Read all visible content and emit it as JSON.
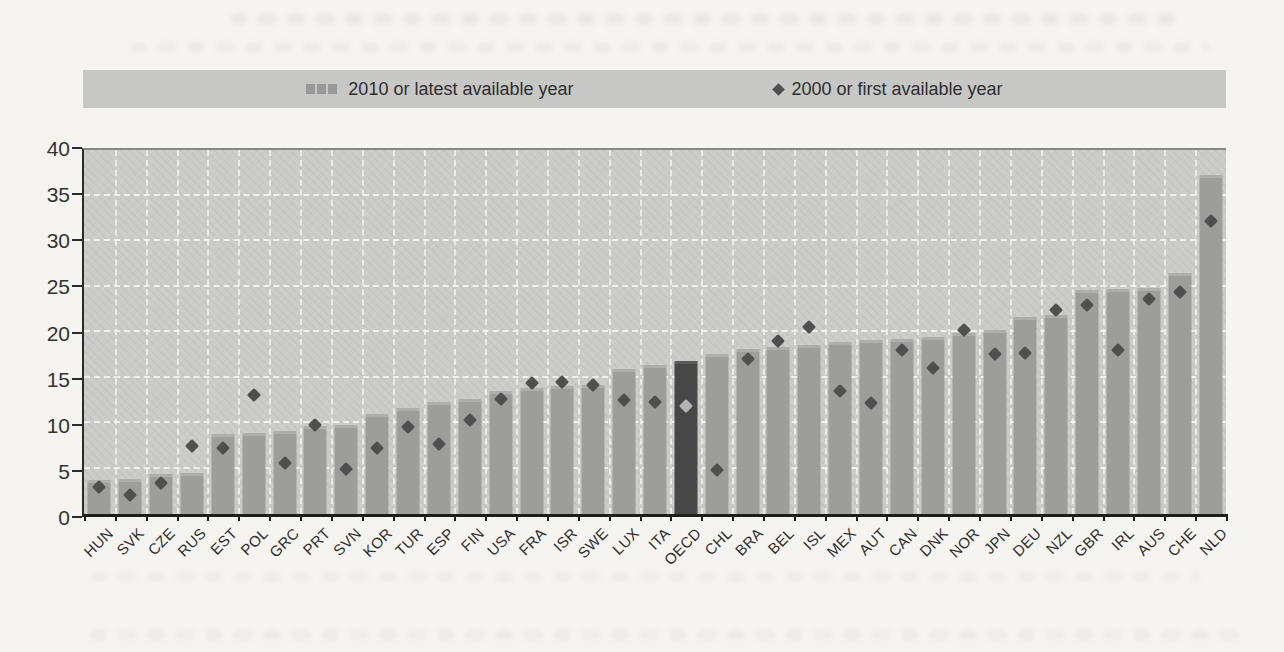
{
  "legend": {
    "items": [
      {
        "icon": "bar-swatch-icon",
        "label": "2010 or latest available year"
      },
      {
        "icon": "diamond-icon",
        "label": "2000 or first available year"
      }
    ]
  },
  "chart_data": {
    "type": "bar",
    "title": "",
    "categories": [
      "HUN",
      "SVK",
      "CZE",
      "RUS",
      "EST",
      "POL",
      "GRC",
      "PRT",
      "SVN",
      "KOR",
      "TUR",
      "ESP",
      "FIN",
      "USA",
      "FRA",
      "ISR",
      "SWE",
      "LUX",
      "ITA",
      "OECD",
      "CHL",
      "BRA",
      "BEL",
      "ISL",
      "MEX",
      "AUT",
      "CAN",
      "DNK",
      "NOR",
      "JPN",
      "DEU",
      "NZL",
      "GBR",
      "IRL",
      "AUS",
      "CHE",
      "NLD"
    ],
    "series": [
      {
        "name": "2010 or latest available year",
        "marker": "bar",
        "values": [
          3.7,
          3.8,
          4.4,
          4.5,
          8.8,
          8.9,
          9.1,
          9.7,
          9.8,
          11.0,
          11.6,
          12.3,
          12.6,
          13.5,
          13.9,
          14.1,
          14.2,
          15.9,
          16.4,
          16.8,
          17.6,
          18.1,
          18.4,
          18.6,
          18.9,
          19.1,
          19.2,
          19.5,
          19.9,
          20.2,
          21.6,
          21.9,
          24.6,
          24.7,
          24.8,
          26.5,
          37.3
        ]
      },
      {
        "name": "2000 or first available year",
        "marker": "diamond",
        "values": [
          3.0,
          2.1,
          3.4,
          7.5,
          7.3,
          13.1,
          5.6,
          9.8,
          5.0,
          7.2,
          9.6,
          7.7,
          10.3,
          12.6,
          14.4,
          14.5,
          14.2,
          12.5,
          12.3,
          11.9,
          4.8,
          17.0,
          19.0,
          20.6,
          13.5,
          12.2,
          18.0,
          16.0,
          20.2,
          17.6,
          17.7,
          22.4,
          23.0,
          18.0,
          23.6,
          24.4,
          32.2
        ]
      }
    ],
    "ylim": [
      0,
      40
    ],
    "yticks": [
      0,
      5,
      10,
      15,
      20,
      25,
      30,
      35,
      40
    ],
    "grid": true,
    "legend_position": "top",
    "highlight_category": "OECD"
  },
  "colors": {
    "page_bg": "#f5f4f0",
    "legend_bg": "#c7c7c6",
    "plot_bg": "#cbcbca",
    "bar": "#9d9d9c",
    "bar_top_edge": "#aeaead",
    "bar_highlight": "#474747",
    "bar_highlight_top_edge": "#5a5a5a",
    "diamond": "#4f4f4f",
    "diamond_on_highlight": "#b4b4b4",
    "gridline": "#f0efe9",
    "axis": "#1d1d1d",
    "text": "#2e2e2e"
  }
}
